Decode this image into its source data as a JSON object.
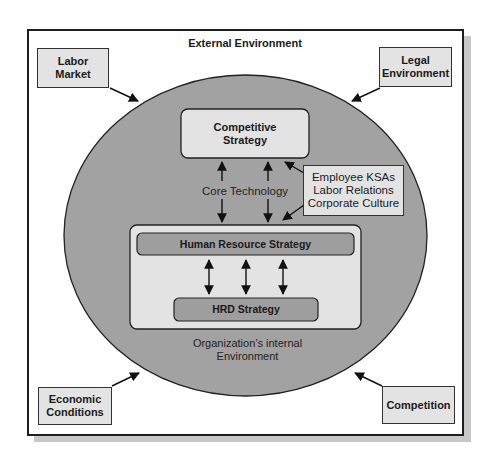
{
  "diagram": {
    "title": "External Environment",
    "external_factors": [
      {
        "id": "labor-market",
        "label": "Labor\nMarket",
        "lines": [
          "Labor",
          "Market"
        ]
      },
      {
        "id": "legal-environment",
        "label": "Legal\nEnvironment",
        "lines": [
          "Legal",
          "Environment"
        ]
      },
      {
        "id": "economic-conditions",
        "label": "Economic\nConditions",
        "lines": [
          "Economic",
          "Conditions"
        ]
      },
      {
        "id": "competition",
        "label": "Competition",
        "lines": [
          "Competition"
        ]
      }
    ],
    "internal": {
      "caption_lines": [
        "Organization’s internal",
        "Environment"
      ],
      "competitive_strategy_lines": [
        "Competitive",
        "Strategy"
      ],
      "core_technology": "Core Technology",
      "influences_lines": [
        "Employee KSAs",
        "Labor Relations",
        "Corporate Culture"
      ],
      "hr_strategy": "Human Resource Strategy",
      "hrd_strategy": "HRD Strategy"
    },
    "colors": {
      "circle_fill": "#a2a2a2",
      "box_fill": "#e3e3e3",
      "bar_fill": "#9e9e9e",
      "outline": "#1e1e1e",
      "shadow": "#c8c8c8"
    }
  }
}
